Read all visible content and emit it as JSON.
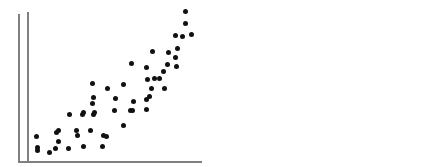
{
  "figure": {
    "width": 446,
    "height": 167,
    "background_color": "#ffffff",
    "point_color": "#111111",
    "axis_color": "#808080",
    "point_diameter_px": 5
  },
  "chart_data": [
    {
      "type": "scatter",
      "title": "",
      "subtitle": "",
      "xlabel": "",
      "ylabel": "",
      "relationship": "positive linear",
      "grid": false,
      "legend": null,
      "tick_labels": {
        "x": [],
        "y": []
      },
      "axes": {
        "origin_px": [
          18,
          161
        ],
        "y_axis_top_px": 14,
        "x_axis_right_px": 192,
        "xlim": [
          0,
          100
        ],
        "ylim": [
          0,
          100
        ]
      },
      "n_points": 22,
      "points_px": [
        [
          37,
          150
        ],
        [
          49,
          152
        ],
        [
          58,
          141
        ],
        [
          58,
          130
        ],
        [
          69,
          114
        ],
        [
          76,
          130
        ],
        [
          82,
          114
        ],
        [
          83,
          112
        ],
        [
          92,
          103
        ],
        [
          92,
          83
        ],
        [
          93,
          114
        ],
        [
          94,
          112
        ],
        [
          93,
          97
        ],
        [
          107,
          88
        ],
        [
          115,
          98
        ],
        [
          123,
          84
        ],
        [
          131,
          63
        ],
        [
          146,
          67
        ],
        [
          147,
          79
        ],
        [
          152,
          51
        ],
        [
          154,
          78
        ],
        [
          168,
          52
        ],
        [
          167,
          64
        ],
        [
          182,
          36
        ]
      ],
      "x": [
        13,
        19,
        23,
        23,
        29,
        32,
        36,
        37,
        42,
        42,
        43,
        43,
        43,
        51,
        56,
        60,
        65,
        74,
        74,
        77,
        78,
        86,
        86,
        94
      ],
      "y": [
        8,
        6,
        14,
        21,
        32,
        21,
        32,
        33,
        39,
        53,
        32,
        33,
        43,
        50,
        43,
        52,
        67,
        64,
        56,
        75,
        56,
        74,
        66,
        85
      ]
    },
    {
      "type": "scatter",
      "title": "",
      "subtitle": "",
      "xlabel": "",
      "ylabel": "",
      "relationship": "positive curvilinear (exponential)",
      "grid": false,
      "legend": null,
      "tick_labels": {
        "x": [],
        "y": []
      },
      "axes": {
        "origin_px": [
          27,
          161
        ],
        "y_axis_top_px": 12,
        "x_axis_right_px": 202,
        "xlim": [
          0,
          100
        ],
        "ylim": [
          0,
          100
        ]
      },
      "n_points": 29,
      "points_px": [
        [
          36,
          136
        ],
        [
          37,
          147
        ],
        [
          56,
          132
        ],
        [
          55,
          148
        ],
        [
          68,
          148
        ],
        [
          77,
          135
        ],
        [
          83,
          146
        ],
        [
          90,
          130
        ],
        [
          103,
          135
        ],
        [
          102,
          146
        ],
        [
          106,
          136
        ],
        [
          114,
          110
        ],
        [
          123,
          125
        ],
        [
          130,
          110
        ],
        [
          132,
          110
        ],
        [
          133,
          101
        ],
        [
          146,
          99
        ],
        [
          146,
          109
        ],
        [
          149,
          96
        ],
        [
          151,
          88
        ],
        [
          159,
          78
        ],
        [
          163,
          71
        ],
        [
          164,
          88
        ],
        [
          175,
          57
        ],
        [
          176,
          66
        ],
        [
          177,
          48
        ],
        [
          175,
          35
        ],
        [
          185,
          23
        ],
        [
          191,
          34
        ],
        [
          185,
          11
        ]
      ],
      "x": [
        5,
        5,
        17,
        16,
        23,
        29,
        32,
        36,
        43,
        43,
        45,
        50,
        55,
        59,
        60,
        61,
        68,
        68,
        70,
        71,
        75,
        78,
        78,
        85,
        85,
        86,
        85,
        90,
        94,
        90
      ],
      "y": [
        17,
        9,
        20,
        9,
        9,
        18,
        10,
        21,
        18,
        10,
        17,
        35,
        24,
        35,
        35,
        41,
        42,
        35,
        44,
        49,
        56,
        61,
        49,
        70,
        64,
        76,
        85,
        93,
        85,
        101
      ]
    }
  ]
}
